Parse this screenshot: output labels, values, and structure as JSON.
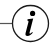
{
  "icon": {
    "name": "info-icon",
    "glyph": "i",
    "label": "Information",
    "stroke_color": "#1a1a1a",
    "glyph_color": "#000000",
    "background": "#ffffff"
  }
}
